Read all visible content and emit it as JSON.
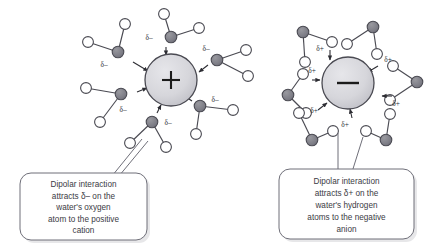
{
  "figure": {
    "background_color": "#ffffff",
    "palette": {
      "oxygen_fill": "#7d7d86",
      "hydrogen_fill": "#ffffff",
      "ion_fill": "#d4d4d8",
      "stroke": "#3b3b44",
      "callout_fill": "#ffffff",
      "callout_stroke": "#6f6f79",
      "text_color": "#3b3b44",
      "shadow_color": "#c9c9cf"
    }
  },
  "panels": [
    {
      "id": "cation-panel",
      "ion": {
        "name": "positive-cation",
        "sign": "+",
        "charge": "positive",
        "cx": 171,
        "cy": 80,
        "r": 26
      },
      "delta_label": "δ–",
      "delta_polarity": "negative",
      "orientation_note": "oxygen atom of water points toward the cation",
      "waters": [
        {
          "index": 0,
          "o": [
            118,
            52
          ],
          "h": [
            [
              125,
              24
            ],
            [
              88,
              42
            ]
          ],
          "label_pos": [
            104,
            67
          ],
          "arrow": [
            [
              133,
              62
            ],
            [
              148,
              71
            ]
          ]
        },
        {
          "index": 1,
          "o": [
            171,
            37
          ],
          "h": [
            [
              164,
              14
            ],
            [
              199,
              28
            ]
          ],
          "label_pos": [
            149,
            37
          ],
          "arrow": [
            [
              166,
              47
            ],
            [
              166,
              55
            ]
          ]
        },
        {
          "index": 2,
          "o": [
            217,
            60
          ],
          "h": [
            [
              246,
              50
            ],
            [
              248,
              76
            ]
          ],
          "label_pos": [
            206,
            48
          ],
          "arrow": [
            [
              208,
              65
            ],
            [
              199,
              72
            ]
          ]
        },
        {
          "index": 3,
          "o": [
            121,
            94
          ],
          "h": [
            [
              86,
              88
            ],
            [
              100,
              122
            ]
          ],
          "label_pos": [
            123,
            110
          ],
          "arrow": [
            [
              137,
              92
            ],
            [
              147,
              88
            ]
          ]
        },
        {
          "index": 4,
          "o": [
            200,
            106
          ],
          "h": [
            [
              233,
              110
            ],
            [
              196,
              134
            ]
          ],
          "label_pos": [
            213,
            99
          ],
          "arrow": [
            [
              192,
              101
            ],
            [
              183,
              95
            ]
          ]
        },
        {
          "index": 5,
          "o": [
            152,
            122
          ],
          "h": [
            [
              130,
              143
            ],
            [
              166,
              147
            ]
          ],
          "label_pos": [
            166,
            122
          ],
          "arrow": [
            [
              157,
              113
            ],
            [
              161,
              105
            ]
          ]
        }
      ],
      "callout": {
        "name": "cation-callout",
        "lines": [
          "Dipolar interaction",
          "attracts δ– on the",
          "water's oxygen",
          "atom to the positive",
          "cation"
        ],
        "box": {
          "x": 20,
          "y": 173,
          "w": 127,
          "h": 67,
          "r": 11
        },
        "leader_from": [
          112,
          173
        ],
        "leader_to": [
          143,
          139
        ]
      }
    },
    {
      "id": "anion-panel",
      "ion": {
        "name": "negative-anion",
        "sign": "–",
        "charge": "negative",
        "cx": 348,
        "cy": 83,
        "r": 26
      },
      "delta_label": "δ+",
      "delta_polarity": "positive",
      "orientation_note": "hydrogen atoms of water point toward the anion",
      "waters": [
        {
          "index": 0,
          "o": [
            303,
            32
          ],
          "h": [
            [
              332,
              42
            ],
            [
              305,
              62
            ]
          ],
          "label_pos": [
            316,
            67
          ],
          "arrow": [
            [
              318,
              55
            ],
            [
              324,
              64
            ]
          ]
        },
        {
          "index": 1,
          "o": [
            373,
            27
          ],
          "h": [
            [
              347,
              44
            ],
            [
              377,
              54
            ]
          ],
          "label_pos": [
            388,
            70
          ],
          "arrow": [
            [
              371,
              65
            ],
            [
              362,
              70
            ]
          ]
        },
        {
          "index": 2,
          "o": [
            288,
            95
          ],
          "h": [
            [
              303,
              74
            ],
            [
              306,
              113
            ]
          ],
          "label_pos": [
            314,
            82
          ],
          "arrow": [
            [
              312,
              80
            ],
            [
              320,
              80
            ]
          ]
        },
        {
          "index": 3,
          "o": [
            417,
            82
          ],
          "h": [
            [
              393,
              66
            ],
            [
              390,
              100
            ]
          ],
          "label_pos": [
            381,
            103
          ],
          "arrow": [
            [
              392,
              96
            ],
            [
              382,
              96
            ]
          ]
        },
        {
          "index": 4,
          "o": [
            312,
            140
          ],
          "h": [
            [
              299,
              113
            ],
            [
              333,
              131
            ]
          ],
          "label_pos": [
            314,
            113
          ],
          "arrow": [
            [
              318,
              110
            ],
            [
              327,
              103
            ]
          ]
        },
        {
          "index": 5,
          "o": [
            386,
            140
          ],
          "h": [
            [
              366,
              131
            ],
            [
              390,
              114
            ]
          ],
          "label_pos": [
            345,
            125
          ],
          "arrow": [
            [
              352,
              116
            ],
            [
              350,
              108
            ]
          ]
        }
      ],
      "callout": {
        "name": "anion-callout",
        "lines": [
          "Dipolar interaction",
          "attracts δ+ on the",
          "water's hydrogen",
          "atoms to the negative",
          "anion"
        ],
        "box": {
          "x": 279,
          "y": 169,
          "w": 135,
          "h": 70,
          "r": 11
        },
        "leader_from": [
          338,
          169
        ],
        "leader_to": [
          338,
          133
        ],
        "leader2_from": [
          352,
          169
        ],
        "leader2_to": [
          362,
          136
        ]
      }
    }
  ]
}
